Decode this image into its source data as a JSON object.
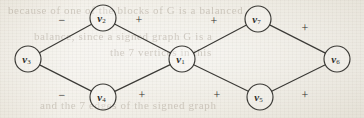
{
  "figure": {
    "background_color": "#efece4",
    "ink_color": "#3b3a36",
    "width": 364,
    "height": 118
  },
  "ghost_text": {
    "top": "because of one of the blocks of  G is a balanced",
    "middle": "balance, since a signed graph  G  is a",
    "middle2": "the  7  vertices  in  this",
    "bottom": "and  the  7  edges  of  the  signed  graph"
  },
  "graph": {
    "type": "signed-graph",
    "nodes": [
      {
        "id": "v1",
        "letter": "v",
        "sub": "1",
        "cx": 182,
        "cy": 59,
        "r": 13
      },
      {
        "id": "v2",
        "letter": "v",
        "sub": "2",
        "cx": 103,
        "cy": 18,
        "r": 13
      },
      {
        "id": "v3",
        "letter": "v",
        "sub": "3",
        "cx": 28,
        "cy": 59,
        "r": 13
      },
      {
        "id": "v4",
        "letter": "v",
        "sub": "4",
        "cx": 103,
        "cy": 97,
        "r": 13
      },
      {
        "id": "v5",
        "letter": "v",
        "sub": "5",
        "cx": 260,
        "cy": 97,
        "r": 13
      },
      {
        "id": "v6",
        "letter": "v",
        "sub": "6",
        "cx": 337,
        "cy": 59,
        "r": 13
      },
      {
        "id": "v7",
        "letter": "v",
        "sub": "7",
        "cx": 258,
        "cy": 19,
        "r": 13
      }
    ],
    "edges": [
      {
        "id": "e-v3-v2",
        "from": "v3",
        "to": "v2",
        "sign": "−",
        "sign_x": 62,
        "sign_y": 20
      },
      {
        "id": "e-v3-v4",
        "from": "v3",
        "to": "v4",
        "sign": "−",
        "sign_x": 62,
        "sign_y": 95
      },
      {
        "id": "e-v2-v1",
        "from": "v2",
        "to": "v1",
        "sign": "+",
        "sign_x": 139,
        "sign_y": 20
      },
      {
        "id": "e-v4-v1",
        "from": "v4",
        "to": "v1",
        "sign": "+",
        "sign_x": 142,
        "sign_y": 95
      },
      {
        "id": "e-v1-v7",
        "from": "v1",
        "to": "v7",
        "sign": "+",
        "sign_x": 214,
        "sign_y": 21
      },
      {
        "id": "e-v1-v5",
        "from": "v1",
        "to": "v5",
        "sign": "+",
        "sign_x": 217,
        "sign_y": 95
      },
      {
        "id": "e-v7-v6",
        "from": "v7",
        "to": "v6",
        "sign": "+",
        "sign_x": 305,
        "sign_y": 28
      },
      {
        "id": "e-v5-v6",
        "from": "v5",
        "to": "v6",
        "sign": "+",
        "sign_x": 305,
        "sign_y": 95
      }
    ]
  }
}
